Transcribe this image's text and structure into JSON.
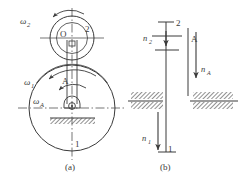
{
  "figure": {
    "title_caption_a": "(a)",
    "title_caption_b": "(b)",
    "type": "engineering-schematic"
  },
  "panel_a": {
    "caption": "(a)",
    "labels": {
      "omega2": "ω",
      "omega2_sub": "2",
      "omega1": "ω",
      "omega1_sub": "1",
      "omegaA": "ω",
      "omegaA_sub": "A",
      "gear2": "2",
      "gear1": "1",
      "carrierA": "A",
      "centerO": "O"
    },
    "elements": {
      "big_circle_label": "1",
      "small_circle_label": "2",
      "arm_label": "A",
      "pivot_label": "O"
    }
  },
  "panel_b": {
    "caption": "(b)",
    "labels": {
      "n2": "n",
      "n2_sub": "2",
      "n1": "n",
      "n1_sub": "1",
      "nA": "n",
      "nA_sub": "A",
      "gear2": "2",
      "gear1": "1",
      "carrierA": "A"
    }
  },
  "colors": {
    "line": "#3a3a3a",
    "hatch": "#555555",
    "background": "#ffffff"
  }
}
